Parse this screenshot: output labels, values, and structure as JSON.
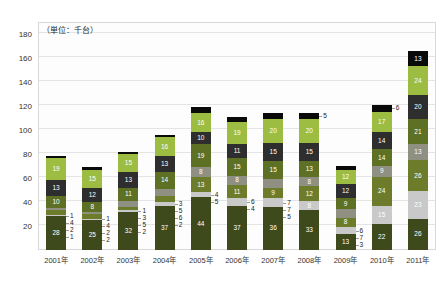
{
  "chart_data": {
    "type": "bar",
    "variant": "stacked-vertical",
    "title": "",
    "subtitle": "",
    "unit_note": "（単位：千台）",
    "xlabel": "",
    "ylabel": "",
    "categories": [
      "2001年",
      "2002年",
      "2003年",
      "2004年",
      "2005年",
      "2006年",
      "2007年",
      "2008年",
      "2009年",
      "2010年",
      "2011年"
    ],
    "ylim": [
      0,
      190
    ],
    "yticks": [
      20,
      40,
      60,
      80,
      100,
      120,
      140,
      160,
      180
    ],
    "ytick_labels": [
      "20",
      "40",
      "60",
      "80",
      "100",
      "120",
      "140",
      "160",
      "180"
    ],
    "grid": true,
    "legend": "none",
    "stack_order": "bottom-to-top",
    "series": [
      {
        "name": "series-1",
        "color": "#3f4a1c",
        "values": [
          28,
          25,
          32,
          37,
          44,
          37,
          36,
          33,
          13,
          22,
          26
        ]
      },
      {
        "name": "series-2",
        "color": "#c9c9c9",
        "values": [
          1,
          1,
          1,
          3,
          4,
          6,
          7,
          8,
          6,
          15,
          23
        ]
      },
      {
        "name": "series-3",
        "color": "#6d7c2b",
        "values": [
          4,
          4,
          3,
          5,
          13,
          11,
          9,
          12,
          8,
          24,
          26
        ]
      },
      {
        "name": "series-4",
        "color": "#8f8f82",
        "values": [
          2,
          2,
          5,
          6,
          8,
          8,
          7,
          8,
          7,
          9,
          13
        ]
      },
      {
        "name": "series-5",
        "color": "#5d7024",
        "values": [
          10,
          8,
          11,
          14,
          19,
          15,
          15,
          13,
          9,
          14,
          21
        ]
      },
      {
        "name": "series-6",
        "color": "#2e2e2e",
        "values": [
          13,
          12,
          13,
          13,
          10,
          11,
          15,
          15,
          12,
          14,
          20
        ]
      },
      {
        "name": "series-7",
        "color": "#9cbc42",
        "values": [
          19,
          15,
          15,
          16,
          16,
          19,
          20,
          20,
          12,
          17,
          24
        ]
      },
      {
        "name": "series-8",
        "color": "#0a0a0a",
        "values": [
          1,
          2,
          2,
          2,
          5,
          4,
          5,
          5,
          3,
          6,
          13
        ]
      }
    ],
    "totals": [
      78,
      69,
      82,
      96,
      119,
      111,
      114,
      114,
      70,
      121,
      166
    ],
    "label_placement": {
      "inside_threshold": 7,
      "note": "Segments smaller than threshold are labelled outside to the right of the bar with a leader line."
    }
  }
}
